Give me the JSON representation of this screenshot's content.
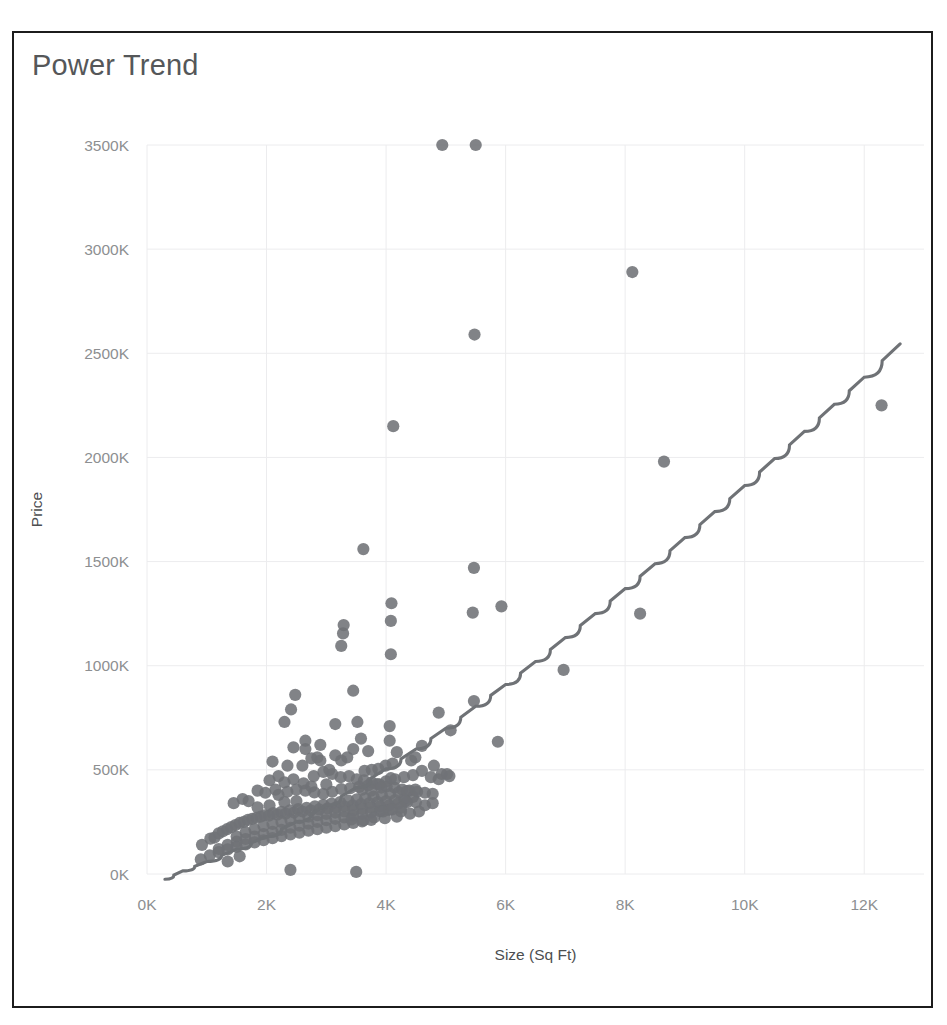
{
  "chart_data": {
    "type": "scatter",
    "title": "Power Trend",
    "xlabel": "Size (Sq Ft)",
    "ylabel": "Price",
    "xlim": [
      0,
      13000
    ],
    "ylim": [
      -60000,
      3650000
    ],
    "grid": true,
    "legend": null,
    "x_ticks": [
      0,
      2000,
      4000,
      6000,
      8000,
      10000,
      12000
    ],
    "x_tick_labels": [
      "0K",
      "2K",
      "4K",
      "6K",
      "8K",
      "10K",
      "12K"
    ],
    "y_ticks": [
      0,
      500000,
      1000000,
      1500000,
      2000000,
      2500000,
      3000000,
      3500000
    ],
    "y_tick_labels": [
      "0K",
      "500K",
      "1000K",
      "1500K",
      "2000K",
      "2500K",
      "3000K",
      "3500K"
    ],
    "series": [
      {
        "name": "Price vs Size",
        "marker": "circle",
        "color": "#6f7276",
        "points": [
          [
            4940,
            3500000
          ],
          [
            5500,
            3500000
          ],
          [
            8120,
            2890000
          ],
          [
            5480,
            2590000
          ],
          [
            4120,
            2150000
          ],
          [
            8650,
            1980000
          ],
          [
            12290,
            2250000
          ],
          [
            3620,
            1560000
          ],
          [
            5470,
            1470000
          ],
          [
            4090,
            1300000
          ],
          [
            5930,
            1285000
          ],
          [
            8250,
            1250000
          ],
          [
            5450,
            1255000
          ],
          [
            4080,
            1215000
          ],
          [
            3290,
            1195000
          ],
          [
            3280,
            1155000
          ],
          [
            3250,
            1095000
          ],
          [
            4080,
            1055000
          ],
          [
            6970,
            980000
          ],
          [
            2480,
            860000
          ],
          [
            3450,
            880000
          ],
          [
            5470,
            830000
          ],
          [
            2410,
            790000
          ],
          [
            4880,
            775000
          ],
          [
            2300,
            730000
          ],
          [
            3150,
            720000
          ],
          [
            3520,
            730000
          ],
          [
            4060,
            710000
          ],
          [
            5080,
            690000
          ],
          [
            5870,
            635000
          ],
          [
            3580,
            650000
          ],
          [
            4060,
            640000
          ],
          [
            4600,
            615000
          ],
          [
            2650,
            600000
          ],
          [
            2900,
            620000
          ],
          [
            3700,
            590000
          ],
          [
            4180,
            585000
          ],
          [
            4490,
            560000
          ],
          [
            4800,
            520000
          ],
          [
            4930,
            480000
          ],
          [
            5060,
            470000
          ],
          [
            4420,
            545000
          ],
          [
            4110,
            530000
          ],
          [
            3990,
            520000
          ],
          [
            3870,
            505000
          ],
          [
            3760,
            500000
          ],
          [
            3640,
            495000
          ],
          [
            2200,
            470000
          ],
          [
            2050,
            450000
          ],
          [
            2300,
            440000
          ],
          [
            2450,
            455000
          ],
          [
            2620,
            435000
          ],
          [
            2790,
            470000
          ],
          [
            2950,
            490000
          ],
          [
            3100,
            480000
          ],
          [
            3240,
            465000
          ],
          [
            3380,
            470000
          ],
          [
            3510,
            455000
          ],
          [
            3630,
            450000
          ],
          [
            3760,
            440000
          ],
          [
            3890,
            430000
          ],
          [
            4010,
            420000
          ],
          [
            4140,
            415000
          ],
          [
            4270,
            405000
          ],
          [
            4390,
            400000
          ],
          [
            4520,
            395000
          ],
          [
            4650,
            390000
          ],
          [
            4780,
            385000
          ],
          [
            4450,
            370000
          ],
          [
            4300,
            360000
          ],
          [
            4150,
            355000
          ],
          [
            4000,
            350000
          ],
          [
            3860,
            345000
          ],
          [
            3720,
            340000
          ],
          [
            3580,
            335000
          ],
          [
            3440,
            330000
          ],
          [
            3300,
            325000
          ],
          [
            3160,
            320000
          ],
          [
            3020,
            315000
          ],
          [
            2880,
            310000
          ],
          [
            2740,
            305000
          ],
          [
            2600,
            300000
          ],
          [
            2460,
            295000
          ],
          [
            2320,
            290000
          ],
          [
            2180,
            285000
          ],
          [
            2040,
            280000
          ],
          [
            1900,
            275000
          ],
          [
            1760,
            265000
          ],
          [
            1620,
            250000
          ],
          [
            1480,
            235000
          ],
          [
            1340,
            215000
          ],
          [
            1200,
            195000
          ],
          [
            1060,
            170000
          ],
          [
            920,
            140000
          ],
          [
            1130,
            175000
          ],
          [
            1270,
            205000
          ],
          [
            1410,
            225000
          ],
          [
            1550,
            245000
          ],
          [
            1690,
            260000
          ],
          [
            1830,
            270000
          ],
          [
            1970,
            282000
          ],
          [
            2110,
            292000
          ],
          [
            2250,
            298000
          ],
          [
            2390,
            305000
          ],
          [
            2530,
            312000
          ],
          [
            2670,
            318000
          ],
          [
            2810,
            325000
          ],
          [
            2950,
            332000
          ],
          [
            3090,
            338000
          ],
          [
            3230,
            345000
          ],
          [
            3370,
            352000
          ],
          [
            3510,
            358000
          ],
          [
            3650,
            365000
          ],
          [
            3790,
            372000
          ],
          [
            3930,
            378000
          ],
          [
            4070,
            385000
          ],
          [
            4210,
            392000
          ],
          [
            4350,
            398000
          ],
          [
            4490,
            405000
          ],
          [
            2200,
            380000
          ],
          [
            2350,
            395000
          ],
          [
            2500,
            405000
          ],
          [
            2650,
            400000
          ],
          [
            2800,
            392000
          ],
          [
            2950,
            385000
          ],
          [
            3100,
            395000
          ],
          [
            3250,
            408000
          ],
          [
            3400,
            412000
          ],
          [
            3550,
            418000
          ],
          [
            3700,
            425000
          ],
          [
            3850,
            432000
          ],
          [
            4000,
            445000
          ],
          [
            4150,
            455000
          ],
          [
            4300,
            465000
          ],
          [
            4450,
            475000
          ],
          [
            1500,
            180000
          ],
          [
            1650,
            200000
          ],
          [
            1800,
            215000
          ],
          [
            1950,
            230000
          ],
          [
            2100,
            240000
          ],
          [
            2250,
            250000
          ],
          [
            2400,
            260000
          ],
          [
            2550,
            268000
          ],
          [
            2700,
            275000
          ],
          [
            2850,
            282000
          ],
          [
            3000,
            288000
          ],
          [
            3150,
            295000
          ],
          [
            3300,
            300000
          ],
          [
            3450,
            305000
          ],
          [
            3600,
            312000
          ],
          [
            3750,
            318000
          ],
          [
            3900,
            325000
          ],
          [
            4050,
            330000
          ],
          [
            4200,
            338000
          ],
          [
            4350,
            345000
          ],
          [
            1200,
            120000
          ],
          [
            1350,
            140000
          ],
          [
            1500,
            155000
          ],
          [
            1650,
            168000
          ],
          [
            1800,
            180000
          ],
          [
            1950,
            192000
          ],
          [
            2100,
            202000
          ],
          [
            2250,
            212000
          ],
          [
            2400,
            222000
          ],
          [
            2550,
            232000
          ],
          [
            2700,
            242000
          ],
          [
            2850,
            250000
          ],
          [
            3000,
            258000
          ],
          [
            3150,
            265000
          ],
          [
            3300,
            272000
          ],
          [
            3450,
            280000
          ],
          [
            3600,
            288000
          ],
          [
            3750,
            295000
          ],
          [
            3900,
            302000
          ],
          [
            4050,
            308000
          ],
          [
            900,
            70000
          ],
          [
            1050,
            90000
          ],
          [
            1200,
            105000
          ],
          [
            1350,
            118000
          ],
          [
            1500,
            130000
          ],
          [
            1650,
            142000
          ],
          [
            1800,
            152000
          ],
          [
            1950,
            162000
          ],
          [
            2100,
            172000
          ],
          [
            2250,
            182000
          ],
          [
            2400,
            190000
          ],
          [
            2550,
            198000
          ],
          [
            2700,
            208000
          ],
          [
            2850,
            215000
          ],
          [
            3000,
            222000
          ],
          [
            3150,
            230000
          ],
          [
            3300,
            238000
          ],
          [
            3450,
            245000
          ],
          [
            3600,
            252000
          ],
          [
            3750,
            260000
          ],
          [
            1450,
            340000
          ],
          [
            1600,
            360000
          ],
          [
            2350,
            520000
          ],
          [
            2100,
            540000
          ],
          [
            2750,
            555000
          ],
          [
            2050,
            330000
          ],
          [
            2600,
            520000
          ],
          [
            2900,
            545000
          ],
          [
            3350,
            560000
          ],
          [
            3150,
            570000
          ],
          [
            3450,
            600000
          ],
          [
            3000,
            430000
          ],
          [
            2750,
            420000
          ],
          [
            2500,
            350000
          ],
          [
            2300,
            345000
          ],
          [
            1850,
            320000
          ],
          [
            4600,
            495000
          ],
          [
            4750,
            465000
          ],
          [
            4880,
            455000
          ],
          [
            5020,
            480000
          ],
          [
            3500,
            10000
          ],
          [
            2400,
            20000
          ],
          [
            1350,
            60000
          ],
          [
            1550,
            85000
          ],
          [
            4250,
            300000
          ],
          [
            4400,
            290000
          ],
          [
            4550,
            300000
          ],
          [
            4180,
            275000
          ],
          [
            3980,
            268000
          ],
          [
            3800,
            272000
          ],
          [
            3620,
            258000
          ],
          [
            3420,
            262000
          ],
          [
            4650,
            330000
          ],
          [
            4780,
            340000
          ],
          [
            4500,
            345000
          ],
          [
            4320,
            350000
          ],
          [
            2650,
            640000
          ],
          [
            2850,
            560000
          ],
          [
            3050,
            500000
          ],
          [
            3250,
            545000
          ],
          [
            3600,
            405000
          ],
          [
            3750,
            400000
          ],
          [
            3920,
            415000
          ],
          [
            4080,
            460000
          ],
          [
            2150,
            405000
          ],
          [
            1980,
            390000
          ],
          [
            1850,
            400000
          ],
          [
            1700,
            350000
          ],
          [
            2450,
            608000
          ],
          [
            3950,
            300000
          ],
          [
            4100,
            310000
          ],
          [
            4250,
            318000
          ]
        ]
      }
    ],
    "trendline": {
      "name": "Power Trend",
      "color": "#6f7276",
      "model": "power",
      "points": [
        [
          300,
          -25000
        ],
        [
          600,
          15000
        ],
        [
          1000,
          60000
        ],
        [
          1500,
          120000
        ],
        [
          2000,
          180000
        ],
        [
          2500,
          250000
        ],
        [
          3000,
          330000
        ],
        [
          3500,
          415000
        ],
        [
          4000,
          505000
        ],
        [
          4500,
          600000
        ],
        [
          5000,
          700000
        ],
        [
          5500,
          805000
        ],
        [
          6000,
          910000
        ],
        [
          6500,
          1020000
        ],
        [
          7000,
          1135000
        ],
        [
          7500,
          1250000
        ],
        [
          8000,
          1370000
        ],
        [
          8500,
          1490000
        ],
        [
          9000,
          1615000
        ],
        [
          9500,
          1740000
        ],
        [
          10000,
          1865000
        ],
        [
          10500,
          1995000
        ],
        [
          11000,
          2125000
        ],
        [
          11500,
          2255000
        ],
        [
          12000,
          2385000
        ],
        [
          12600,
          2545000
        ]
      ]
    }
  },
  "colors": {
    "marker": "#6f7276",
    "trendline": "#6f7276",
    "gridline": "#ececee",
    "tick_text": "#8d8f91",
    "axis_title": "#4c4e50",
    "title_text": "#555759",
    "frame_border": "#1c1c1c",
    "background": "#ffffff"
  }
}
